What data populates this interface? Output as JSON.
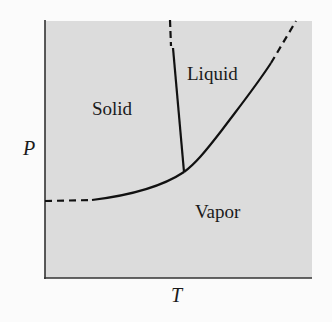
{
  "diagram": {
    "axes": {
      "x_label": "T",
      "y_label": "P"
    },
    "regions": [
      {
        "name": "solid",
        "label": "Solid"
      },
      {
        "name": "liquid",
        "label": "Liquid"
      },
      {
        "name": "vapor",
        "label": "Vapor"
      }
    ],
    "colors": {
      "plot_background": "#dcdcdc",
      "curve": "#111111",
      "axis": "#333333",
      "page_background": "#fbfbfb"
    }
  }
}
